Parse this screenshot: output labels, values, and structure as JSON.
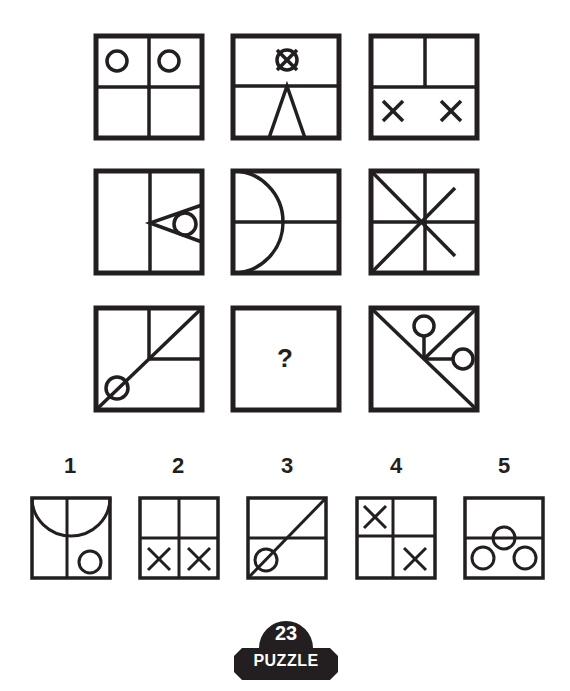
{
  "puzzle": {
    "grid": [
      {
        "id": "r1c1",
        "description": "2x2 grid, circles in top two cells"
      },
      {
        "id": "r1c2",
        "description": "horizontal divider, crossed circle on top, inverted V below"
      },
      {
        "id": "r1c3",
        "description": "top half split vertically, two X marks in bottom half"
      },
      {
        "id": "r2c1",
        "description": "vertical divider, triangle pointing left with inscribed circle on right edge"
      },
      {
        "id": "r2c2",
        "description": "horizontal divider, half-circle arc on left edge"
      },
      {
        "id": "r2c3",
        "description": "cross plus both diagonals meeting at center (star)"
      },
      {
        "id": "r3c1",
        "description": "diagonal from bottom-left to top-right, top-right quadrant lines, circle on diagonal near bottom-left"
      },
      {
        "id": "r3c2",
        "description": "missing panel",
        "text": "?"
      },
      {
        "id": "r3c3",
        "description": "diagonal top-left to bottom-right, lines to top and right with circles"
      }
    ],
    "answers": [
      {
        "label": "1",
        "description": "vertical divider, top half-circle arc, small circle bottom-right"
      },
      {
        "label": "2",
        "description": "2x2 grid, X marks in both bottom cells"
      },
      {
        "label": "3",
        "description": "horizontal divider, diagonal bottom-left to top-right, circle on diagonal at bottom-left"
      },
      {
        "label": "4",
        "description": "2x2 grid, X in top-left and bottom-right"
      },
      {
        "label": "5",
        "description": "horizontal divider, three circles in triangle arrangement at bottom"
      }
    ]
  },
  "badge": {
    "number": "23",
    "word": "PUZZLE"
  },
  "colors": {
    "ink": "#231f20",
    "background": "#ffffff"
  }
}
